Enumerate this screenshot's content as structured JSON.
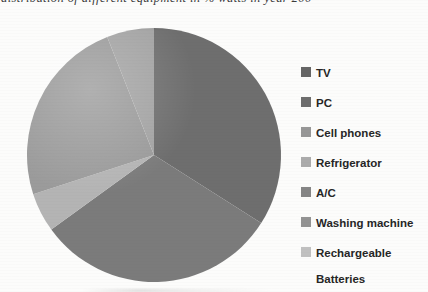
{
  "figure": {
    "title_fragment": "distribution of different equipment in % watts in year 200",
    "background": "#fcfcfb"
  },
  "chart_data": {
    "type": "pie",
    "labels": [
      "TV",
      "PC",
      "Cell phones",
      "Refrigerator",
      "A/C",
      "Washing machine",
      "Rechargeable Batteries"
    ],
    "values": [
      34,
      31,
      5,
      0,
      24,
      6,
      0
    ],
    "unit": "percent",
    "start_angle_deg": 0,
    "direction": "clockwise",
    "slice_colors": [
      "#6e6e6e",
      "#7b7b7b",
      "#b4b4b4",
      "#ababab",
      "#9b9b9b",
      "#a3a3a3",
      "#c0c0c0"
    ],
    "legend_position": "right"
  },
  "legend": {
    "items": [
      {
        "label": "TV",
        "color": "#656565"
      },
      {
        "label": "PC",
        "color": "#6d6d6d"
      },
      {
        "label": "Cell phones",
        "color": "#979797"
      },
      {
        "label": "Refrigerator",
        "color": "#ababab"
      },
      {
        "label": "A/C",
        "color": "#858585"
      },
      {
        "label": "Washing machine",
        "color": "#939393"
      },
      {
        "label": "Rechargeable\nBatteries",
        "color": "#c0c0c0"
      }
    ]
  }
}
